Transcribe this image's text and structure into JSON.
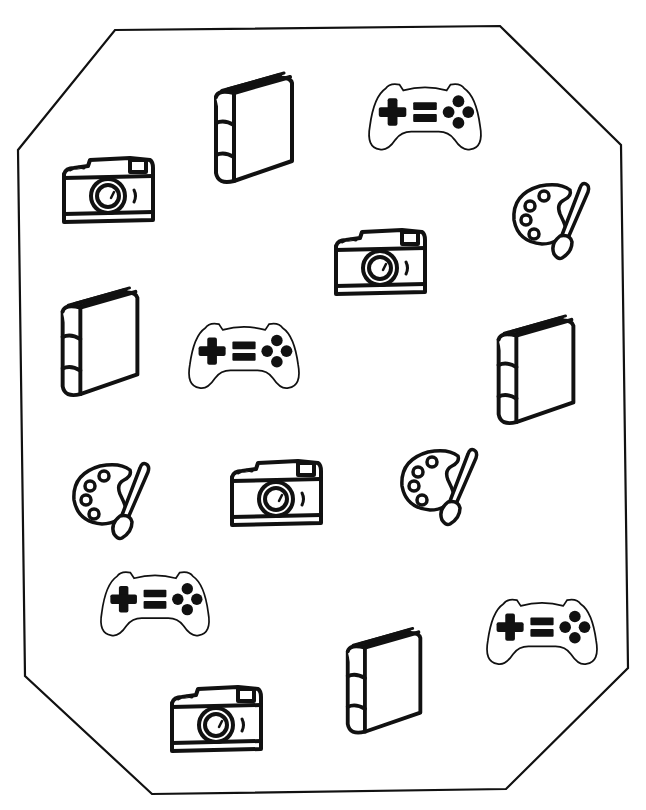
{
  "worksheet": {
    "background": "#ffffff",
    "stroke_color": "#111111",
    "frame_points": "115,30 500,26 621,145 628,668 506,789 152,794 25,676 18,150",
    "items": [
      {
        "type": "book",
        "x": 210,
        "y": 68,
        "w": 90,
        "h": 122,
        "rot": -8
      },
      {
        "type": "gamepad",
        "x": 366,
        "y": 76,
        "w": 118,
        "h": 80
      },
      {
        "type": "camera",
        "x": 60,
        "y": 156,
        "w": 96,
        "h": 70
      },
      {
        "type": "palette",
        "x": 510,
        "y": 180,
        "w": 82,
        "h": 82
      },
      {
        "type": "camera",
        "x": 332,
        "y": 228,
        "w": 96,
        "h": 70
      },
      {
        "type": "book",
        "x": 56,
        "y": 284,
        "w": 90,
        "h": 118,
        "rot": -6
      },
      {
        "type": "gamepad",
        "x": 186,
        "y": 316,
        "w": 116,
        "h": 78
      },
      {
        "type": "book",
        "x": 492,
        "y": 312,
        "w": 90,
        "h": 118,
        "rot": -6
      },
      {
        "type": "palette",
        "x": 70,
        "y": 460,
        "w": 82,
        "h": 82
      },
      {
        "type": "camera",
        "x": 228,
        "y": 458,
        "w": 96,
        "h": 72
      },
      {
        "type": "palette",
        "x": 398,
        "y": 446,
        "w": 82,
        "h": 82
      },
      {
        "type": "gamepad",
        "x": 98,
        "y": 564,
        "w": 114,
        "h": 78
      },
      {
        "type": "gamepad",
        "x": 484,
        "y": 592,
        "w": 116,
        "h": 78
      },
      {
        "type": "book",
        "x": 342,
        "y": 620,
        "w": 86,
        "h": 124,
        "rot": -6
      },
      {
        "type": "camera",
        "x": 168,
        "y": 684,
        "w": 96,
        "h": 72
      }
    ],
    "counts": {
      "book": 4,
      "gamepad": 4,
      "camera": 4,
      "palette": 3
    }
  }
}
